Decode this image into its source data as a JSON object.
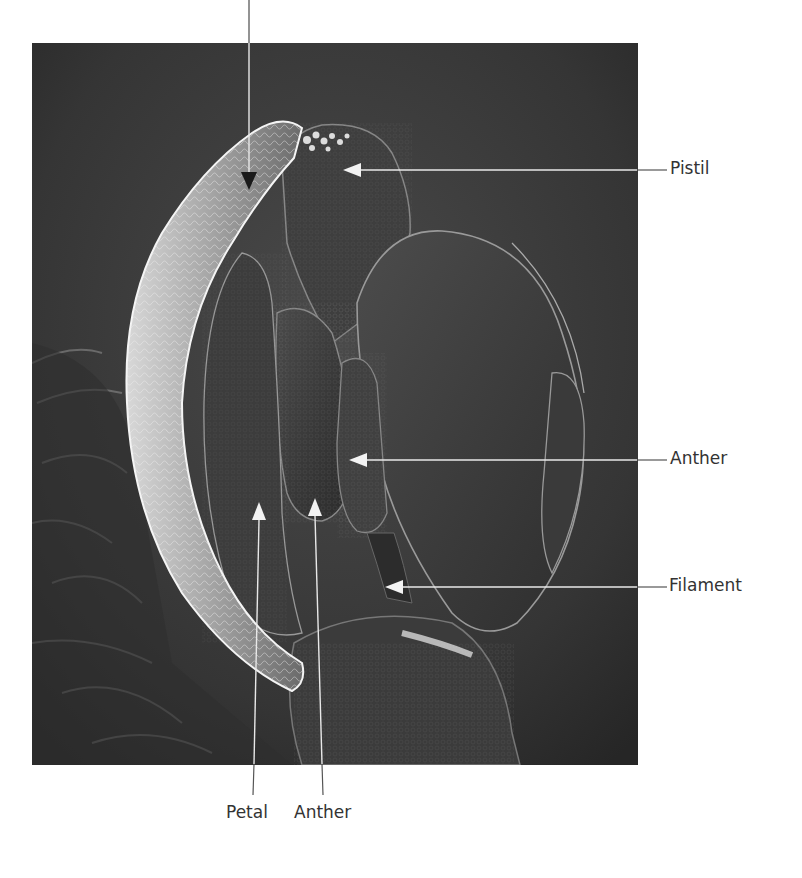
{
  "figure": {
    "labels": {
      "pistil": "Pistil",
      "anther_right": "Anther",
      "filament": "Filament",
      "petal": "Petal",
      "anther_bottom": "Anther"
    },
    "leader_line_color": "#e8e8e8",
    "leader_line_outside_color": "#555555",
    "top_arrow_color": "#1a1a1a"
  }
}
